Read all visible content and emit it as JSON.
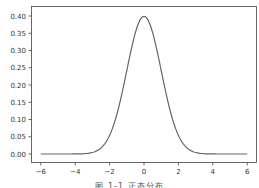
{
  "chart_data": {
    "type": "line",
    "title": "",
    "xlabel": "",
    "ylabel": "",
    "xlim": [
      -6.5,
      6.5
    ],
    "ylim": [
      -0.02,
      0.42
    ],
    "grid": false,
    "legend": null,
    "x_ticks": [
      -6,
      -4,
      -2,
      0,
      2,
      4,
      6
    ],
    "x_tick_labels": [
      "−6",
      "−4",
      "−2",
      "0",
      "2",
      "4",
      "6"
    ],
    "y_ticks": [
      0.0,
      0.05,
      0.1,
      0.15,
      0.2,
      0.25,
      0.3,
      0.35,
      0.4
    ],
    "y_tick_labels": [
      "0.00",
      "0.05",
      "0.10",
      "0.15",
      "0.20",
      "0.25",
      "0.30",
      "0.35",
      "0.40"
    ],
    "series": [
      {
        "name": "normal pdf (μ=0, σ=1)",
        "color": "#666666",
        "x": [
          -6,
          -5,
          -4,
          -3.5,
          -3,
          -2.5,
          -2,
          -1.5,
          -1,
          -0.5,
          0,
          0.5,
          1,
          1.5,
          2,
          2.5,
          3,
          3.5,
          4,
          5,
          6
        ],
        "y": [
          0.0,
          0.0,
          0.0001,
          0.0009,
          0.0044,
          0.0175,
          0.054,
          0.1295,
          0.242,
          0.3521,
          0.3989,
          0.3521,
          0.242,
          0.1295,
          0.054,
          0.0175,
          0.0044,
          0.0009,
          0.0001,
          0.0,
          0.0
        ]
      }
    ],
    "caption": "图 1-1  正态分布"
  },
  "caption": "图 1-1  正态分布"
}
